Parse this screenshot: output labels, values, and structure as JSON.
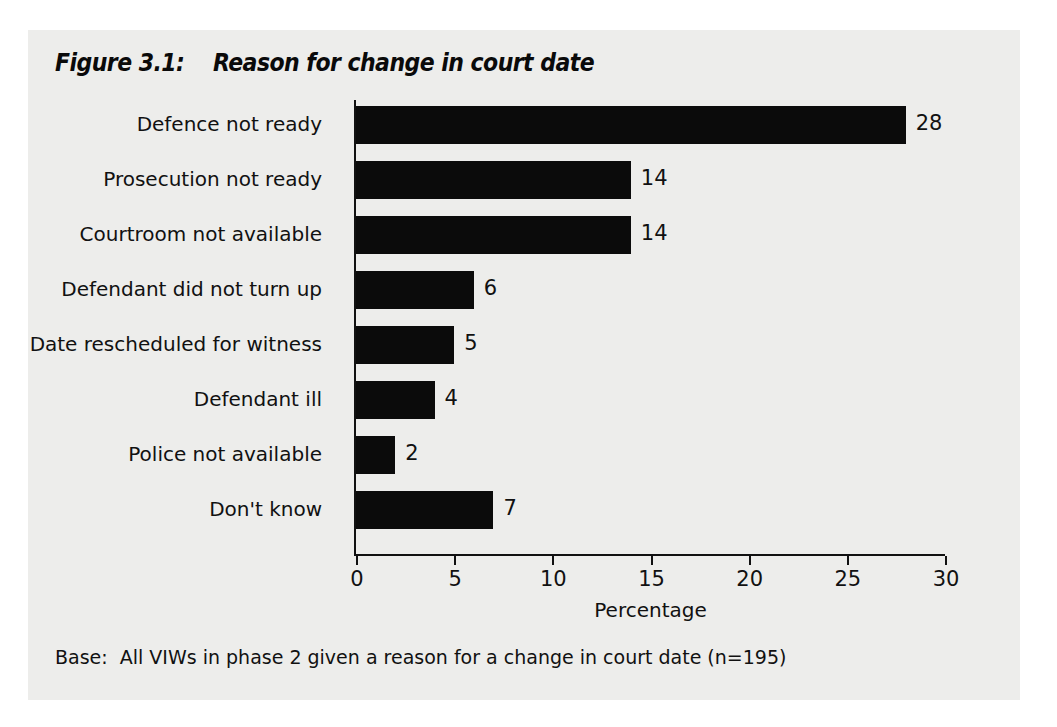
{
  "figure": {
    "title": "Figure 3.1:    Reason for change in court date",
    "base_note": "Base:  All VIWs in phase 2 given a reason for a change in court date (n=195)"
  },
  "colors": {
    "panel_background": "#ededeb",
    "bar_fill": "#0b0b0b",
    "axis": "#111111",
    "page_background": "#ffffff"
  },
  "chart_data": {
    "type": "bar",
    "orientation": "horizontal",
    "title": "Reason for change in court date",
    "xlabel": "Percentage",
    "ylabel": "",
    "xlim": [
      0,
      30
    ],
    "xticks": [
      0,
      5,
      10,
      15,
      20,
      25,
      30
    ],
    "xtick_labels": [
      "0",
      "5",
      "10",
      "15",
      "20",
      "25",
      "30"
    ],
    "grid": false,
    "legend": false,
    "categories": [
      "Defence not ready",
      "Prosecution not ready",
      "Courtroom not available",
      "Defendant did not turn up",
      "Date rescheduled for witness",
      "Defendant ill",
      "Police not available",
      "Don't know"
    ],
    "values": [
      28,
      14,
      14,
      6,
      5,
      4,
      2,
      7
    ],
    "data_labels": [
      "28",
      "14",
      "14",
      "6",
      "5",
      "4",
      "2",
      "7"
    ]
  }
}
